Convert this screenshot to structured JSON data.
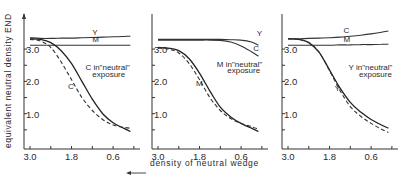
{
  "figure": {
    "ylabel": "equivalent neutral density END",
    "xlabel": "density of neutral wedge",
    "xlabel_arrow": "left-arrow"
  },
  "chart_data": [
    {
      "type": "line",
      "title": "",
      "xlabel": "density of neutral wedge",
      "ylabel": "equivalent neutral density END",
      "x_ticks": [
        "3.0",
        "1.8",
        "0.6"
      ],
      "y_ticks": [
        "3.0",
        "2.0",
        "1.0"
      ],
      "xlim": [
        3.0,
        0.0
      ],
      "ylim": [
        0.0,
        3.6
      ],
      "grid": false,
      "x": [
        3.0,
        2.7,
        2.4,
        2.1,
        1.8,
        1.5,
        1.2,
        0.9,
        0.6,
        0.3,
        0.1
      ],
      "series": [
        {
          "name": "Y",
          "style": "solid",
          "values": [
            3.35,
            3.33,
            3.33,
            3.34,
            3.34,
            3.35,
            3.36,
            3.37,
            3.38,
            3.39,
            3.4
          ]
        },
        {
          "name": "M",
          "style": "solid",
          "values": [
            3.12,
            3.12,
            3.12,
            3.12,
            3.12,
            3.12,
            3.12,
            3.12,
            3.12,
            3.12,
            3.12
          ]
        },
        {
          "name": "C in \"neutral\" exposure",
          "style": "solid",
          "values": [
            3.32,
            3.3,
            3.2,
            2.95,
            2.55,
            2.0,
            1.45,
            1.0,
            0.72,
            0.55,
            0.45
          ]
        },
        {
          "name": "C",
          "style": "dashed",
          "values": [
            3.3,
            3.25,
            3.05,
            2.6,
            2.05,
            1.5,
            1.1,
            0.82,
            0.65,
            0.58,
            0.55
          ]
        }
      ],
      "annotations": [
        {
          "text": "Y",
          "x": 1.2,
          "y": 3.45
        },
        {
          "text": "M",
          "x": 1.2,
          "y": 3.22
        },
        {
          "text": "C in\"neutral\"",
          "x": 1.4,
          "y": 2.35
        },
        {
          "text": "exposure",
          "x": 1.2,
          "y": 2.15
        },
        {
          "text": "C",
          "x": 1.9,
          "y": 1.75
        }
      ]
    },
    {
      "type": "line",
      "title": "",
      "xlabel": "density of neutral wedge",
      "ylabel": "equivalent neutral density END",
      "x_ticks": [
        "3.0",
        "1.8",
        "0.6"
      ],
      "y_ticks": [
        "3.0",
        "2.0",
        "1.0"
      ],
      "xlim": [
        3.0,
        0.0
      ],
      "ylim": [
        0.0,
        3.6
      ],
      "grid": false,
      "x": [
        3.0,
        2.7,
        2.4,
        2.1,
        1.8,
        1.5,
        1.2,
        0.9,
        0.6,
        0.3,
        0.1
      ],
      "series": [
        {
          "name": "Y",
          "style": "solid",
          "values": [
            3.3,
            3.3,
            3.3,
            3.3,
            3.3,
            3.3,
            3.3,
            3.29,
            3.28,
            3.22,
            3.12
          ]
        },
        {
          "name": "C",
          "style": "solid",
          "values": [
            3.28,
            3.28,
            3.28,
            3.28,
            3.28,
            3.28,
            3.27,
            3.22,
            3.1,
            2.92,
            2.78
          ]
        },
        {
          "name": "M in \"neutral\" exposure",
          "style": "solid",
          "values": [
            3.05,
            3.03,
            2.95,
            2.7,
            2.25,
            1.7,
            1.2,
            0.9,
            0.7,
            0.55,
            0.45
          ]
        },
        {
          "name": "M",
          "style": "dashed",
          "values": [
            3.03,
            3.0,
            2.88,
            2.55,
            2.05,
            1.5,
            1.1,
            0.85,
            0.7,
            0.6,
            0.52
          ]
        }
      ],
      "annotations": [
        {
          "text": "Y",
          "x": 0.15,
          "y": 3.4
        },
        {
          "text": "C",
          "x": 0.25,
          "y": 2.95
        },
        {
          "text": "M in\"neutral\"",
          "x": 1.3,
          "y": 2.45
        },
        {
          "text": "exposure",
          "x": 1.0,
          "y": 2.25
        },
        {
          "text": "M",
          "x": 1.9,
          "y": 1.85
        }
      ]
    },
    {
      "type": "line",
      "title": "",
      "xlabel": "density of neutral wedge",
      "ylabel": "equivalent neutral density END",
      "x_ticks": [
        "3.0",
        "1.8",
        "0.6"
      ],
      "y_ticks": [
        "3.0",
        "2.0",
        "1.0"
      ],
      "xlim": [
        3.0,
        0.0
      ],
      "ylim": [
        0.0,
        3.6
      ],
      "grid": false,
      "x": [
        3.0,
        2.7,
        2.4,
        2.1,
        1.8,
        1.5,
        1.2,
        0.9,
        0.6,
        0.3,
        0.1
      ],
      "series": [
        {
          "name": "C",
          "style": "solid",
          "values": [
            3.32,
            3.32,
            3.33,
            3.34,
            3.35,
            3.37,
            3.4,
            3.43,
            3.47,
            3.52,
            3.56
          ]
        },
        {
          "name": "M",
          "style": "solid",
          "values": [
            3.12,
            3.12,
            3.12,
            3.12,
            3.12,
            3.13,
            3.13,
            3.14,
            3.14,
            3.15,
            3.15
          ]
        },
        {
          "name": "Y in \"neutral\" exposure",
          "style": "solid",
          "values": [
            3.32,
            3.3,
            3.2,
            2.9,
            2.35,
            1.8,
            1.35,
            1.05,
            0.82,
            0.65,
            0.55
          ]
        },
        {
          "name": "Y",
          "style": "dashed",
          "values": [
            3.32,
            3.3,
            3.2,
            2.9,
            2.33,
            1.72,
            1.22,
            0.92,
            0.7,
            0.52,
            0.42
          ]
        }
      ],
      "annotations": [
        {
          "text": "C",
          "x": 1.4,
          "y": 3.5
        },
        {
          "text": "M",
          "x": 1.4,
          "y": 3.22
        },
        {
          "text": "Y  in\"neutral\"",
          "x": 1.25,
          "y": 2.35
        },
        {
          "text": "exposure",
          "x": 0.95,
          "y": 2.15
        },
        {
          "text": "Y",
          "x": 1.65,
          "y": 1.7
        }
      ]
    }
  ],
  "panels_layout": [
    {
      "x0": 24,
      "x1": 136
    },
    {
      "x0": 152,
      "x1": 264
    },
    {
      "x0": 282,
      "x1": 394
    }
  ]
}
